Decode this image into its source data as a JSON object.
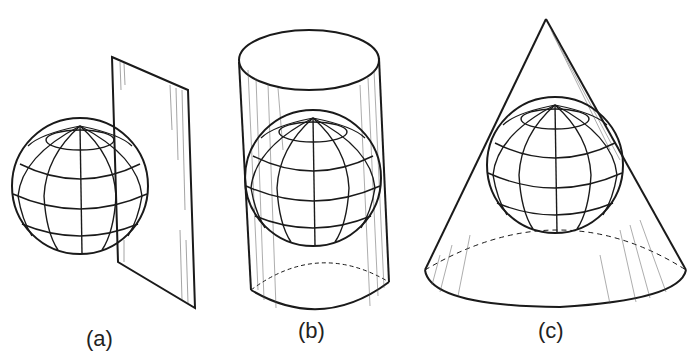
{
  "figure": {
    "panels": [
      {
        "id": "a",
        "label": "(a)",
        "surface": "plane"
      },
      {
        "id": "b",
        "label": "(b)",
        "surface": "cylinder"
      },
      {
        "id": "c",
        "label": "(c)",
        "surface": "cone"
      }
    ]
  },
  "colors": {
    "ink": "#1a1a1a",
    "background": "#ffffff"
  }
}
